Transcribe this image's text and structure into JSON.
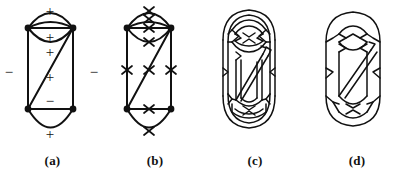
{
  "figure": {
    "background": "#ffffff",
    "ink": "#111111",
    "panels": [
      {
        "id": "a",
        "caption": "(a)",
        "description": "signed plane graph with plus and minus edge labels",
        "signs": [
          {
            "label": "+",
            "x": 50,
            "y": 11,
            "edge": "top-arc-outer"
          },
          {
            "label": "+",
            "x": 50,
            "y": 37,
            "edge": "lens-upper-arc"
          },
          {
            "label": "+",
            "x": 50,
            "y": 52,
            "edge": "lens-chord"
          },
          {
            "label": "−",
            "x": 9,
            "y": 72,
            "edge": "left-vertical"
          },
          {
            "label": "−",
            "x": 92,
            "y": 72,
            "edge": "right-vertical"
          },
          {
            "label": "+",
            "x": 50,
            "y": 77,
            "edge": "diagonal"
          },
          {
            "label": "−",
            "x": 50,
            "y": 101,
            "edge": "bottom-horizontal"
          },
          {
            "label": "+",
            "x": 50,
            "y": 133,
            "edge": "bottom-arc"
          }
        ],
        "vertices": [
          {
            "x": 28,
            "y": 28,
            "name": "top-left"
          },
          {
            "x": 73,
            "y": 28,
            "name": "top-right"
          },
          {
            "x": 28,
            "y": 109,
            "name": "bottom-left"
          },
          {
            "x": 73,
            "y": 109,
            "name": "bottom-right"
          }
        ]
      },
      {
        "id": "b",
        "caption": "(b)",
        "description": "same graph with crossing marks on every edge",
        "marks": [
          {
            "x": 43,
            "y": 13,
            "edge": "top-arc-outer"
          },
          {
            "x": 43,
            "y": 31,
            "edge": "lens-upper-arc"
          },
          {
            "x": 43,
            "y": 45,
            "edge": "lens-chord"
          },
          {
            "x": 13,
            "y": 70,
            "edge": "left-vertical"
          },
          {
            "x": 43,
            "y": 70,
            "edge": "diagonal"
          },
          {
            "x": 73,
            "y": 70,
            "edge": "right-vertical"
          },
          {
            "x": 43,
            "y": 109,
            "edge": "bottom-horizontal"
          },
          {
            "x": 43,
            "y": 131,
            "edge": "bottom-arc"
          }
        ],
        "vertices": [
          {
            "x": 22,
            "y": 28,
            "name": "top-left"
          },
          {
            "x": 66,
            "y": 28,
            "name": "top-right"
          },
          {
            "x": 22,
            "y": 109,
            "name": "bottom-left"
          },
          {
            "x": 66,
            "y": 109,
            "name": "bottom-right"
          }
        ]
      },
      {
        "id": "c",
        "caption": "(c)",
        "description": "doubled band diagram obtained by replacing each edge with a twisted band"
      },
      {
        "id": "d",
        "caption": "(d)",
        "description": "resulting link diagram after smoothing the bands"
      }
    ]
  }
}
